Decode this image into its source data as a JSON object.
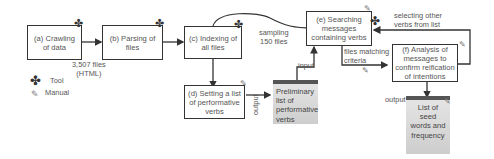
{
  "nodes": {
    "a": {
      "label": "(a) Crawling of data",
      "line1": "(a) Crawling",
      "line2": "of data",
      "type": "tool"
    },
    "b": {
      "label": "(b) Parsing of files",
      "line1": "(b) Parsing of",
      "line2": "files",
      "type": "tool"
    },
    "c": {
      "label": "(c) Indexing of all files",
      "line1": "(c) Indexing of",
      "line2": "all files",
      "type": "tool"
    },
    "d": {
      "label": "(d) Setting a list of performative verbs",
      "line1": "(d) Setting a list",
      "line2": "of performative",
      "line3": "verbs",
      "type": "manual"
    },
    "e": {
      "label": "(e) Searching messages containing verbs",
      "line1": "(e) Searching",
      "line2": "messages",
      "line3": "containing verbs",
      "type": "tool"
    },
    "f": {
      "label": "(f) Analysis of messages to confirm reification of intentions",
      "line1": "(f) Analysis of",
      "line2": "messages to",
      "line3": "confirm reification",
      "line4": "of intentions",
      "type": "manual"
    }
  },
  "documents": {
    "preliminary": {
      "line1": "Preliminary",
      "line2": "list of",
      "line3": "performative",
      "line4": "verbs"
    },
    "seed": {
      "line1": "List of",
      "line2": "seed",
      "line3": "words and",
      "line4": "frequency"
    }
  },
  "edge_labels": {
    "files_count_1": "3,507 files",
    "files_count_2": "(HTML)",
    "sampling_1": "sampling",
    "sampling_2": "150 files",
    "selecting_1": "selecting other",
    "selecting_2": "verbs from list",
    "matching_1": "files matching",
    "matching_2": "criteria",
    "input": "input",
    "output_d": "output",
    "output_f": "output"
  },
  "legend": {
    "tool": "Tool",
    "manual": "Manual"
  }
}
